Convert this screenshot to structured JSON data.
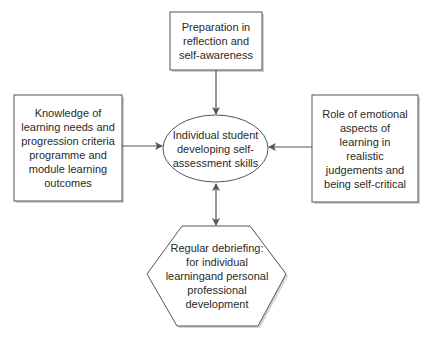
{
  "diagram": {
    "colors": {
      "stroke": "#555555",
      "shadow": "#bbbbbb",
      "fill": "#ffffff",
      "text": "#2a2a2a"
    },
    "nodes": {
      "top": {
        "shape": "rectangle",
        "lines": [
          "Preparation in",
          "reflection and",
          "self-awareness"
        ]
      },
      "left": {
        "shape": "rectangle",
        "lines": [
          "Knowledge of",
          "learning needs and",
          "progression criteria",
          "programme and",
          "module learning",
          "outcomes"
        ]
      },
      "right": {
        "shape": "rectangle",
        "lines": [
          "Role of emotional",
          "aspects of",
          "learning in",
          "realistic",
          "judgements and",
          "being self-critical"
        ]
      },
      "center": {
        "shape": "ellipse",
        "lines": [
          "Individual student",
          "developing self-",
          "assessment skills"
        ]
      },
      "bottom": {
        "shape": "hexagon",
        "lines": [
          "Regular debriefing:",
          "for individual",
          "learningand personal",
          "professional",
          "development"
        ]
      }
    },
    "edges": [
      {
        "from": "top",
        "to": "center",
        "direction": "single"
      },
      {
        "from": "left",
        "to": "center",
        "direction": "single"
      },
      {
        "from": "right",
        "to": "center",
        "direction": "single"
      },
      {
        "from": "center",
        "to": "bottom",
        "direction": "double"
      }
    ]
  }
}
